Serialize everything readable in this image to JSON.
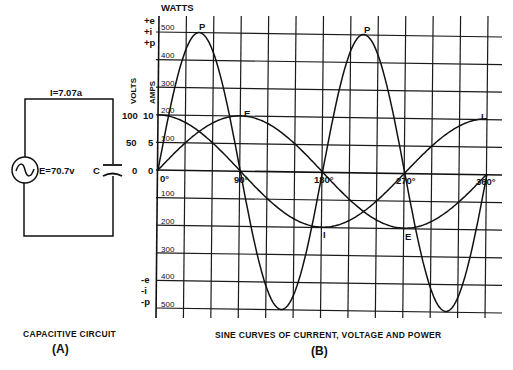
{
  "circuit": {
    "current_label": "I=7.07a",
    "voltage_label": "E=70.7v",
    "capacitor_label": "C",
    "caption": "CAPACITIVE CIRCUIT",
    "caption_letter": "(A)"
  },
  "graph": {
    "watts_label": "WATTS",
    "volts_label": "VOLTS",
    "amps_label": "AMPS",
    "positive_labels": [
      "+e",
      "+i",
      "+p"
    ],
    "negative_labels": [
      "-e",
      "-i",
      "-p"
    ],
    "volts_ticks": [
      "100",
      "50",
      "0"
    ],
    "amps_ticks": [
      "10",
      "5",
      "0"
    ],
    "watts_ticks_positive": [
      "500",
      "400",
      "300",
      "200",
      "100"
    ],
    "watts_ticks_negative": [
      "100",
      "200",
      "300",
      "400",
      "500"
    ],
    "degree_labels": [
      "0°",
      "90°",
      "180°",
      "270°",
      "360°"
    ],
    "curve_labels": {
      "power_1": "P",
      "power_2": "P",
      "voltage_top": "E",
      "current_right": "I",
      "current_bottom": "I",
      "voltage_bottom": "E"
    },
    "caption": "SINE CURVES OF CURRENT, VOLTAGE AND POWER",
    "caption_letter": "(B)"
  },
  "chart_data": {
    "type": "line",
    "title": "SINE CURVES OF CURRENT, VOLTAGE AND POWER",
    "xlabel": "Phase angle (degrees)",
    "ylabel": "VOLTS / AMPS / WATTS",
    "x": [
      0,
      30,
      45,
      60,
      90,
      120,
      135,
      150,
      180,
      210,
      225,
      240,
      270,
      300,
      315,
      330,
      360
    ],
    "xlim": [
      0,
      360
    ],
    "x_ticks": [
      "0°",
      "90°",
      "180°",
      "270°",
      "360°"
    ],
    "ylim_watts": [
      -500,
      500
    ],
    "ylim_volts": [
      -100,
      100
    ],
    "ylim_amps": [
      -10,
      10
    ],
    "grid": true,
    "series": [
      {
        "name": "E (voltage, volts)",
        "values": [
          0,
          50,
          70.7,
          86.6,
          100,
          86.6,
          70.7,
          50,
          0,
          -50,
          -70.7,
          -86.6,
          -100,
          -86.6,
          -70.7,
          -50,
          0
        ]
      },
      {
        "name": "I (current, amps)",
        "values": [
          10,
          8.66,
          7.07,
          5,
          0,
          -5,
          -7.07,
          -8.66,
          -10,
          -8.66,
          -7.07,
          -5,
          0,
          5,
          7.07,
          8.66,
          10
        ]
      },
      {
        "name": "P (power, watts)",
        "values": [
          0,
          433,
          500,
          433,
          0,
          -433,
          -500,
          -433,
          0,
          433,
          500,
          433,
          0,
          -433,
          -500,
          -433,
          0
        ]
      }
    ],
    "annotations": [
      "P",
      "P",
      "E",
      "I",
      "I",
      "E"
    ],
    "circuit_values": {
      "E": "70.7v",
      "I": "7.07a"
    }
  }
}
